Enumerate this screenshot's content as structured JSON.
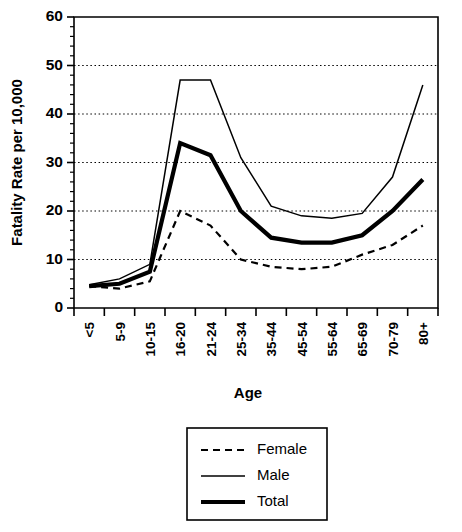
{
  "chart_data": {
    "type": "line",
    "title": "",
    "xlabel": "Age",
    "ylabel": "Fatality Rate per 10,000",
    "categories": [
      "<5",
      "5-9",
      "10-15",
      "16-20",
      "21-24",
      "25-34",
      "35-44",
      "45-54",
      "55-64",
      "65-69",
      "70-79",
      "80+"
    ],
    "ylim": [
      0,
      60
    ],
    "yticks": [
      0,
      10,
      20,
      30,
      40,
      50,
      60
    ],
    "ytick_labels": [
      "0",
      "10",
      "20",
      "30",
      "40",
      "50",
      "60"
    ],
    "yticks_minor_step": 2,
    "grid": "horizontal-dotted",
    "legend_position": "below-center",
    "series": [
      {
        "name": "Female",
        "style": "dashed",
        "values": [
          4.5,
          4.0,
          5.5,
          20.0,
          17.0,
          10.0,
          8.5,
          8.0,
          8.5,
          11.0,
          13.0,
          17.0
        ]
      },
      {
        "name": "Male",
        "style": "thin-solid",
        "values": [
          4.8,
          6.0,
          9.0,
          47.0,
          47.0,
          31.0,
          21.0,
          19.0,
          18.5,
          19.5,
          27.0,
          46.0
        ]
      },
      {
        "name": "Total",
        "style": "thick-solid",
        "values": [
          4.5,
          5.0,
          7.5,
          34.0,
          31.5,
          20.0,
          14.5,
          13.5,
          13.5,
          15.0,
          20.0,
          26.5
        ]
      }
    ]
  },
  "legend": {
    "entries": [
      {
        "label": "Female"
      },
      {
        "label": "Male"
      },
      {
        "label": "Total"
      }
    ]
  },
  "colors": {
    "foreground": "#000000",
    "background": "#ffffff",
    "grid": "#000000"
  }
}
